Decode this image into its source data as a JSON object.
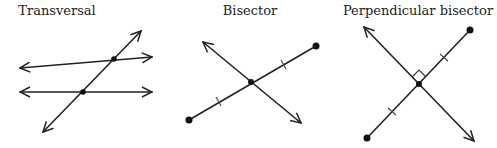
{
  "diagrams": [
    {
      "id": "transversal",
      "title": "Transversal",
      "title_x": 57,
      "elements": {
        "parallel_line_top": {
          "x1": 20,
          "y1": 68,
          "x2": 152,
          "y2": 57,
          "arrows": "both"
        },
        "parallel_line_bottom": {
          "x1": 20,
          "y1": 92,
          "x2": 152,
          "y2": 92,
          "arrows": "both"
        },
        "transversal_line": {
          "x1": 43,
          "y1": 132,
          "x2": 141,
          "y2": 31,
          "arrows": "both"
        },
        "intersection_points": [
          {
            "x": 114,
            "y": 59
          },
          {
            "x": 83,
            "y": 92
          }
        ]
      }
    },
    {
      "id": "bisector",
      "title": "Bisector",
      "title_x": 250,
      "elements": {
        "segment": {
          "x1": 189,
          "y1": 120,
          "x2": 316,
          "y2": 46,
          "endpoints": "dots"
        },
        "bisecting_line": {
          "x1": 203,
          "y1": 42,
          "x2": 301,
          "y2": 123,
          "arrows": "both"
        },
        "midpoint": {
          "x": 251,
          "y": 82
        },
        "congruence_ticks": [
          {
            "x": 219,
            "y": 101
          },
          {
            "x": 284,
            "y": 64
          }
        ]
      }
    },
    {
      "id": "perpendicular-bisector",
      "title": "Perpendicular bisector",
      "title_x": 418,
      "elements": {
        "segment": {
          "x1": 367,
          "y1": 138,
          "x2": 470,
          "y2": 30,
          "endpoints": "dots"
        },
        "bisecting_line": {
          "x1": 364,
          "y1": 27,
          "x2": 474,
          "y2": 141,
          "arrows": "both"
        },
        "midpoint": {
          "x": 419,
          "y": 84
        },
        "right_angle_marker": true,
        "congruence_ticks": [
          {
            "x": 392,
            "y": 111
          },
          {
            "x": 444,
            "y": 57
          }
        ]
      }
    }
  ],
  "colors": {
    "stroke": "#222222",
    "background": "#ffffff"
  }
}
